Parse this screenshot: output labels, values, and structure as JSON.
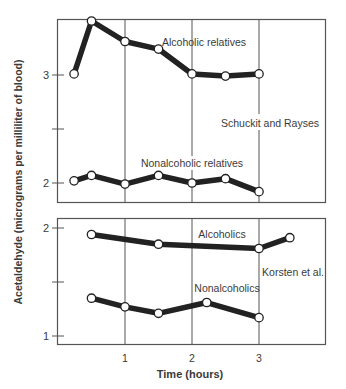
{
  "chart_data": [
    {
      "type": "line",
      "panel": "upper",
      "study": "Schuckit and Rayses",
      "xlabel": "Time (hours)",
      "ylabel": "Acetaldehyde (micrograms per milliliter of blood)",
      "xlim": [
        0,
        4
      ],
      "ylim": [
        1.9,
        3.55
      ],
      "yticks": [
        2,
        2.5,
        3
      ],
      "ytick_labels": [
        "2",
        "",
        "3"
      ],
      "grid_x": [
        1,
        2,
        3
      ],
      "series": [
        {
          "name": "Alcoholic relatives",
          "x": [
            0.24,
            0.5,
            1.0,
            1.5,
            2.0,
            2.5,
            3.0
          ],
          "values": [
            3.01,
            3.5,
            3.31,
            3.24,
            3.01,
            2.99,
            3.01
          ]
        },
        {
          "name": "Nonalcoholic relatives",
          "x": [
            0.24,
            0.5,
            1.0,
            1.5,
            2.0,
            2.5,
            3.0
          ],
          "values": [
            2.02,
            2.07,
            1.99,
            2.07,
            2.0,
            2.04,
            1.92
          ]
        }
      ]
    },
    {
      "type": "line",
      "panel": "lower",
      "study": "Korsten et al.",
      "xlabel": "Time (hours)",
      "ylabel": "Acetaldehyde (micrograms per milliliter of blood)",
      "xlim": [
        0,
        4
      ],
      "ylim": [
        0.93,
        2.06
      ],
      "yticks": [
        1,
        1.5,
        2
      ],
      "ytick_labels": [
        "1",
        "",
        "2"
      ],
      "xticks": [
        1,
        2,
        3
      ],
      "xtick_labels": [
        "1",
        "2",
        "3"
      ],
      "grid_x": [
        1,
        2,
        3
      ],
      "series": [
        {
          "name": "Alcoholics",
          "x": [
            0.5,
            1.5,
            3.0,
            3.46
          ],
          "values": [
            1.94,
            1.85,
            1.81,
            1.91
          ]
        },
        {
          "name": "Nonalcoholics",
          "x": [
            0.5,
            1.0,
            1.5,
            2.22,
            3.0
          ],
          "values": [
            1.35,
            1.27,
            1.21,
            1.31,
            1.17
          ]
        }
      ]
    }
  ],
  "labels": {
    "ylabel": "Acetaldehyde (micrograms per milliliter of blood)",
    "xlabel": "Time (hours)",
    "upper_study": "Schuckit and Rayses",
    "lower_study": "Korsten et al.",
    "upper_series_1": "Alcoholic relatives",
    "upper_series_2": "Nonalcoholic relatives",
    "lower_series_1": "Alcoholics",
    "lower_series_2": "Nonalcoholics",
    "upper_ytick_3": "3",
    "upper_ytick_2": "2",
    "lower_ytick_2": "2",
    "lower_ytick_1": "1",
    "xtick_1": "1",
    "xtick_2": "2",
    "xtick_3": "3"
  },
  "colors": {
    "line": "#222222",
    "frame": "#555555",
    "marker_fill": "#ffffff",
    "text": "#3a3a3a"
  }
}
